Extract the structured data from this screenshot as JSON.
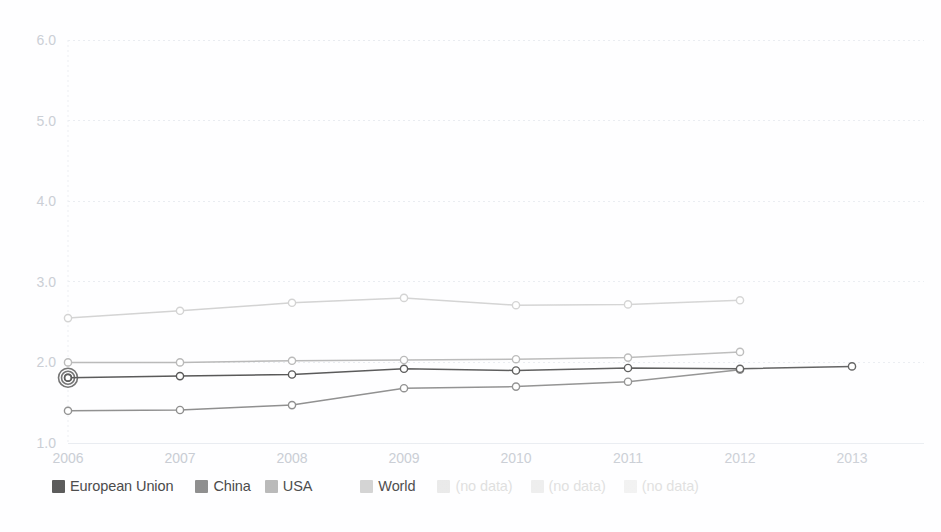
{
  "chart_data": {
    "type": "line",
    "title": "",
    "subtitle": "",
    "xlabel": "",
    "ylabel": "",
    "x": [
      2006,
      2007,
      2008,
      2009,
      2010,
      2011,
      2012,
      2013
    ],
    "xlim": [
      2006,
      2013
    ],
    "ylim": [
      1.0,
      6.0
    ],
    "ytick_labels": [
      "1.0",
      "2.0",
      "3.0",
      "4.0",
      "5.0",
      "6.0"
    ],
    "ytick_values": [
      1.0,
      2.0,
      3.0,
      4.0,
      5.0,
      6.0
    ],
    "xtick_labels": [
      "2006",
      "2007",
      "2008",
      "2009",
      "2010",
      "2011",
      "2012",
      "2013"
    ],
    "grid": "horizontal-dotted",
    "legend_position": "bottom-left",
    "markers": "open-circle",
    "highlighted_point": {
      "series": "European Union",
      "x": 2006,
      "y": 1.81
    },
    "series": [
      {
        "name": "European Union",
        "color": "#585858",
        "values": [
          1.81,
          1.83,
          1.85,
          1.92,
          1.9,
          1.93,
          1.92,
          1.95
        ],
        "x": [
          2006,
          2007,
          2008,
          2009,
          2010,
          2011,
          2012,
          2013
        ]
      },
      {
        "name": "China",
        "color": "#8f8f8f",
        "values": [
          1.4,
          1.41,
          1.47,
          1.68,
          1.7,
          1.76,
          1.91
        ],
        "x": [
          2006,
          2007,
          2008,
          2009,
          2010,
          2011,
          2012
        ]
      },
      {
        "name": "USA",
        "color": "#b9b9b9",
        "values": [
          2.0,
          2.0,
          2.02,
          2.03,
          2.04,
          2.06,
          2.13
        ],
        "x": [
          2006,
          2007,
          2008,
          2009,
          2010,
          2011,
          2012
        ]
      },
      {
        "name": "World",
        "color": "#d3d3d3",
        "values": [
          2.55,
          2.64,
          2.74,
          2.8,
          2.71,
          2.72,
          2.77
        ],
        "x": [
          2006,
          2007,
          2008,
          2009,
          2010,
          2011,
          2012
        ]
      }
    ],
    "empty_series": [
      {
        "name": "(no data)",
        "color": "#e8e8e8"
      },
      {
        "name": "(no data)",
        "color": "#ececec"
      },
      {
        "name": "(no data)",
        "color": "#f0f0f0"
      }
    ]
  },
  "legend": {
    "entries": [
      {
        "label": "European Union",
        "color": "#585858",
        "gap_after": 22
      },
      {
        "label": "China",
        "color": "#8f8f8f",
        "gap_after": 14
      },
      {
        "label": "USA",
        "color": "#b9b9b9",
        "gap_after": 48
      },
      {
        "label": "World",
        "color": "#d3d3d3",
        "gap_after": 22
      },
      {
        "label": "(no data)",
        "color": "#e9e9e9",
        "gap_after": 18
      },
      {
        "label": "(no data)",
        "color": "#ededed",
        "gap_after": 18
      },
      {
        "label": "(no data)",
        "color": "#f1f1f1",
        "gap_after": 0
      }
    ]
  },
  "axes": {
    "y_labels": [
      "6.0",
      "5.0",
      "4.0",
      "3.0",
      "2.0",
      "1.0"
    ],
    "x_labels": [
      "2006",
      "2007",
      "2008",
      "2009",
      "2010",
      "2011",
      "2012",
      "2013"
    ],
    "axis_text_color": "#c9cdd4",
    "grid_color": "#e9ecf1"
  }
}
